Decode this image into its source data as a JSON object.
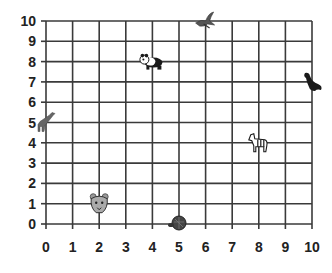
{
  "chart_data": {
    "type": "scatter",
    "title": "",
    "xlabel": "",
    "ylabel": "",
    "xlim": [
      0,
      10
    ],
    "ylim": [
      0,
      10
    ],
    "grid": true,
    "x_ticks": [
      "0",
      "1",
      "2",
      "3",
      "4",
      "5",
      "6",
      "7",
      "8",
      "9",
      "10"
    ],
    "y_ticks": [
      "0",
      "1",
      "2",
      "3",
      "4",
      "5",
      "6",
      "7",
      "8",
      "9",
      "10"
    ],
    "points": [
      {
        "name": "bird",
        "x": 6,
        "y": 10
      },
      {
        "name": "panda",
        "x": 4,
        "y": 8
      },
      {
        "name": "seal",
        "x": 10,
        "y": 7
      },
      {
        "name": "giraffe",
        "x": 0,
        "y": 5
      },
      {
        "name": "zebra",
        "x": 8,
        "y": 4
      },
      {
        "name": "tiger",
        "x": 2,
        "y": 1
      },
      {
        "name": "turtle",
        "x": 5,
        "y": 0
      }
    ]
  },
  "colors": {
    "grid": "#3a3a3a",
    "labels": "#222222",
    "icons": "#1a1a1a"
  }
}
